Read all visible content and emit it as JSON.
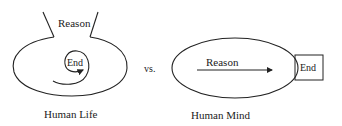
{
  "left_diagram": {
    "top_label": "Reason",
    "center_label": "End",
    "caption": "Human Life"
  },
  "separator": "vs.",
  "right_diagram": {
    "arrow_label": "Reason",
    "box_label": "End",
    "caption": "Human Mind"
  },
  "colors": {
    "stroke": "#222222",
    "background": "#ffffff"
  }
}
